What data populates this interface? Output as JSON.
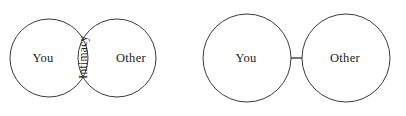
{
  "figure": {
    "background_color": "#ffffff",
    "stroke_color": "#3a3a3a",
    "text_color": "#222222",
    "panels": [
      {
        "id": "overlapping-venn",
        "type": "venn-two-circle-overlapping",
        "circles": [
          {
            "label": "You",
            "cx": 49,
            "cy": 58,
            "r": 39
          },
          {
            "label": "Other",
            "cx": 117,
            "cy": 58,
            "r": 39
          }
        ],
        "overlap_label": "Intimacy",
        "overlap_label_rotation": "-90"
      },
      {
        "id": "separated-pair",
        "type": "two-circles-tangent-with-connector",
        "circles": [
          {
            "label": "You",
            "cx": 247,
            "cy": 58,
            "r": 44
          },
          {
            "label": "Other",
            "cx": 346,
            "cy": 58,
            "r": 44
          }
        ],
        "connector": {
          "x1": 291,
          "y1": 58,
          "x2": 302,
          "y2": 58
        }
      }
    ]
  },
  "labels": {
    "venn_left": "You",
    "venn_right": "Other",
    "venn_overlap": "Intimacy",
    "pair_left": "You",
    "pair_right": "Other"
  }
}
